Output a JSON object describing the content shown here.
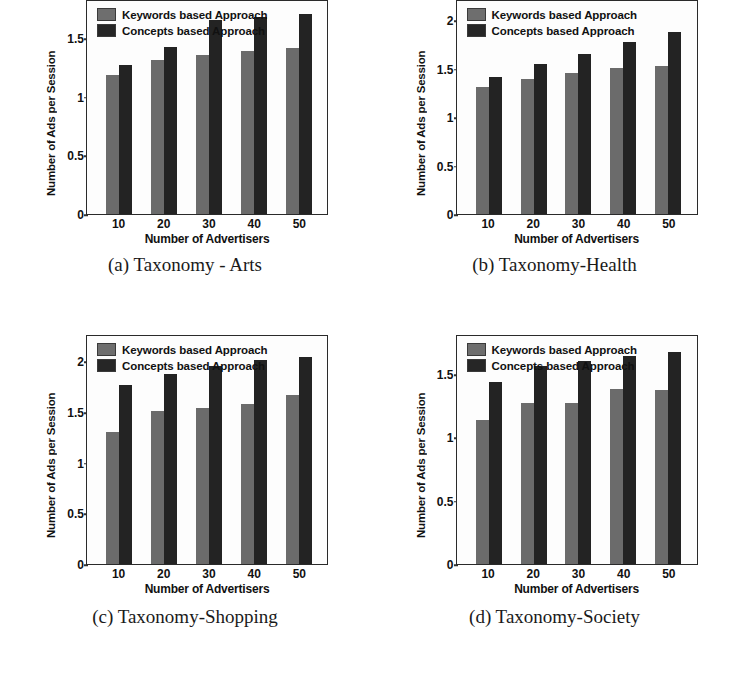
{
  "figure": {
    "common": {
      "xlabel": "Number of Advertisers",
      "ylabel": "Number of Ads per Session",
      "legend": [
        "Keywords based Approach",
        "Concepts based Approach"
      ],
      "categories": [
        "10",
        "20",
        "30",
        "40",
        "50"
      ],
      "colors": {
        "keywords": "#6b6b6b",
        "concepts": "#232323",
        "axis": "#2a2a2a",
        "background": "#ffffff"
      }
    },
    "panels": [
      {
        "id": "a",
        "caption": "(a) Taxonomy - Arts",
        "yticks": [
          "0",
          "0.5",
          "1",
          "1.5"
        ]
      },
      {
        "id": "b",
        "caption": "(b) Taxonomy-Health",
        "yticks": [
          "0",
          "0.5",
          "1",
          "1.5",
          "2"
        ]
      },
      {
        "id": "c",
        "caption": "(c) Taxonomy-Shopping",
        "yticks": [
          "0",
          "0.5",
          "1",
          "1.5",
          "2"
        ]
      },
      {
        "id": "d",
        "caption": "(d) Taxonomy-Society",
        "yticks": [
          "0",
          "0.5",
          "1",
          "1.5"
        ]
      }
    ]
  },
  "chart_data": [
    {
      "type": "bar",
      "title": "(a) Taxonomy - Arts",
      "xlabel": "Number of Advertisers",
      "ylabel": "Number of Ads per Session",
      "categories": [
        "10",
        "20",
        "30",
        "40",
        "50"
      ],
      "series": [
        {
          "name": "Keywords based Approach",
          "values": [
            1.19,
            1.32,
            1.36,
            1.39,
            1.42
          ]
        },
        {
          "name": "Concepts based Approach",
          "values": [
            1.27,
            1.43,
            1.66,
            1.68,
            1.71
          ]
        }
      ],
      "ylim": [
        0,
        1.82
      ],
      "yticks": [
        0,
        0.5,
        1,
        1.5
      ],
      "grid": false,
      "legend_position": "top-left"
    },
    {
      "type": "bar",
      "title": "(b) Taxonomy-Health",
      "xlabel": "Number of Advertisers",
      "ylabel": "Number of Ads per Session",
      "categories": [
        "10",
        "20",
        "30",
        "40",
        "50"
      ],
      "series": [
        {
          "name": "Keywords based Approach",
          "values": [
            1.31,
            1.39,
            1.46,
            1.51,
            1.53
          ]
        },
        {
          "name": "Concepts based Approach",
          "values": [
            1.42,
            1.55,
            1.65,
            1.78,
            1.88
          ]
        }
      ],
      "ylim": [
        0,
        2.2
      ],
      "yticks": [
        0,
        0.5,
        1,
        1.5,
        2
      ],
      "grid": false,
      "legend_position": "top-left"
    },
    {
      "type": "bar",
      "title": "(c) Taxonomy-Shopping",
      "xlabel": "Number of Advertisers",
      "ylabel": "Number of Ads per Session",
      "categories": [
        "10",
        "20",
        "30",
        "40",
        "50"
      ],
      "series": [
        {
          "name": "Keywords based Approach",
          "values": [
            1.3,
            1.51,
            1.54,
            1.58,
            1.67
          ]
        },
        {
          "name": "Concepts based Approach",
          "values": [
            1.77,
            1.88,
            1.95,
            2.01,
            2.04
          ]
        }
      ],
      "ylim": [
        0,
        2.25
      ],
      "yticks": [
        0,
        0.5,
        1,
        1.5,
        2
      ],
      "grid": false,
      "legend_position": "top-left"
    },
    {
      "type": "bar",
      "title": "(d) Taxonomy-Society",
      "xlabel": "Number of Advertisers",
      "ylabel": "Number of Ads per Session",
      "categories": [
        "10",
        "20",
        "30",
        "40",
        "50"
      ],
      "series": [
        {
          "name": "Keywords based Approach",
          "values": [
            1.14,
            1.27,
            1.27,
            1.38,
            1.37
          ]
        },
        {
          "name": "Concepts based Approach",
          "values": [
            1.44,
            1.56,
            1.6,
            1.64,
            1.67
          ]
        }
      ],
      "ylim": [
        0,
        1.8
      ],
      "yticks": [
        0,
        0.5,
        1,
        1.5
      ],
      "grid": false,
      "legend_position": "top-left"
    }
  ]
}
